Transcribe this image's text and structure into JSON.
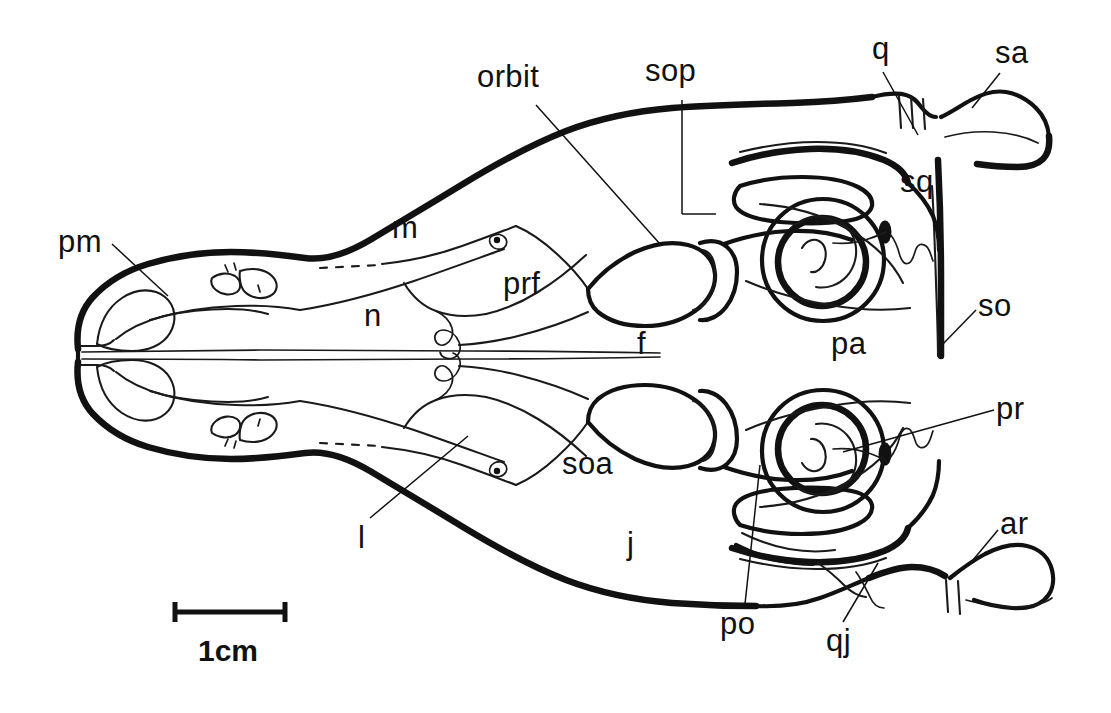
{
  "figure": {
    "kind": "anatomical-line-drawing",
    "background_color": "#ffffff",
    "ink_color": "#111111"
  },
  "scale_bar": {
    "caption": "1cm",
    "bar_length_px": 115,
    "bar_x_start": 172,
    "bar_x_end": 287,
    "bar_y": 612
  },
  "labels": [
    {
      "key": "pm",
      "text": "pm",
      "x": 58,
      "y": 226,
      "leader": true
    },
    {
      "key": "orbit",
      "text": "orbit",
      "x": 477,
      "y": 61,
      "leader": true
    },
    {
      "key": "sop",
      "text": "sop",
      "x": 645,
      "y": 55,
      "leader": true
    },
    {
      "key": "q",
      "text": "q",
      "x": 872,
      "y": 33,
      "leader": true
    },
    {
      "key": "sa",
      "text": "sa",
      "x": 995,
      "y": 37,
      "leader": true
    },
    {
      "key": "sq",
      "text": "sq",
      "x": 900,
      "y": 166,
      "leader": false
    },
    {
      "key": "m",
      "text": "m",
      "x": 392,
      "y": 212,
      "leader": false
    },
    {
      "key": "prf",
      "text": "prf",
      "x": 503,
      "y": 268,
      "leader": false
    },
    {
      "key": "n",
      "text": "n",
      "x": 364,
      "y": 300,
      "leader": false
    },
    {
      "key": "f",
      "text": "f",
      "x": 637,
      "y": 328,
      "leader": false
    },
    {
      "key": "pa",
      "text": "pa",
      "x": 831,
      "y": 328,
      "leader": false
    },
    {
      "key": "so",
      "text": "so",
      "x": 978,
      "y": 290,
      "leader": true
    },
    {
      "key": "pr",
      "text": "pr",
      "x": 996,
      "y": 393,
      "leader": true
    },
    {
      "key": "soa",
      "text": "soa",
      "x": 562,
      "y": 448,
      "leader": false
    },
    {
      "key": "l",
      "text": "l",
      "x": 358,
      "y": 522,
      "leader": true
    },
    {
      "key": "j",
      "text": "j",
      "x": 627,
      "y": 528,
      "leader": false
    },
    {
      "key": "ar",
      "text": "ar",
      "x": 1000,
      "y": 508,
      "leader": true
    },
    {
      "key": "po",
      "text": "po",
      "x": 720,
      "y": 608,
      "leader": true
    },
    {
      "key": "qj",
      "text": "qj",
      "x": 826,
      "y": 625,
      "leader": true
    }
  ],
  "label_text": {
    "pm": "pm",
    "orbit": "orbit",
    "sop": "sop",
    "q": "q",
    "sa": "sa",
    "sq": "sq",
    "m": "m",
    "prf": "prf",
    "n": "n",
    "f": "f",
    "pa": "pa",
    "so": "so",
    "pr": "pr",
    "soa": "soa",
    "l": "l",
    "j": "j",
    "ar": "ar",
    "po": "po",
    "qj": "qj"
  }
}
